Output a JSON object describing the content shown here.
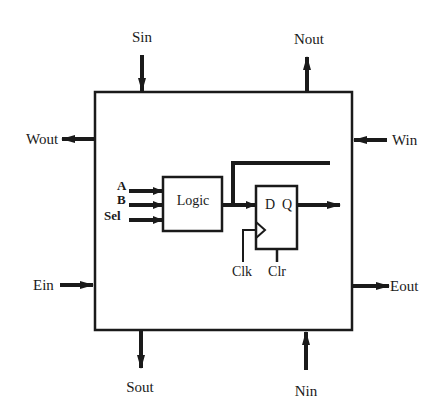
{
  "diagram": {
    "type": "cell-block-diagram",
    "ports": {
      "sin": "Sin",
      "nout": "Nout",
      "wout": "Wout",
      "win": "Win",
      "ein": "Ein",
      "eout": "Eout",
      "sout": "Sout",
      "nin": "Nin"
    },
    "inputs": {
      "a": "A",
      "b": "B",
      "sel": "Sel"
    },
    "logic_block": {
      "label": "Logic"
    },
    "flip_flop": {
      "d": "D",
      "q": "Q",
      "clk": "Clk",
      "clr": "Clr"
    },
    "colors": {
      "stroke": "#1a1a1a",
      "background": "#ffffff"
    }
  }
}
